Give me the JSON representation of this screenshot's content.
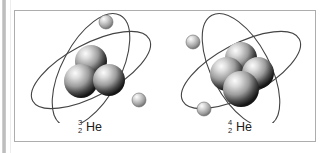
{
  "figure": {
    "caption": "",
    "panel_border_color": "#adadad",
    "background_color": "#ffffff",
    "atoms": [
      {
        "id": "helium-3",
        "element_symbol": "He",
        "mass_number": "3",
        "atomic_number": "2",
        "label_text": "3 2 He",
        "protons": 2,
        "neutrons": 1,
        "nucleon_count": 3,
        "electron_count": 2,
        "orbit_count": 2,
        "nucleons": [
          {
            "name": "nucleon-top",
            "cx": 76,
            "cy": 50,
            "r": 16
          },
          {
            "name": "nucleon-left",
            "cx": 66,
            "cy": 70,
            "r": 17
          },
          {
            "name": "nucleon-right",
            "cx": 94,
            "cy": 69,
            "r": 16
          }
        ],
        "electrons": [
          {
            "name": "electron-1",
            "cx": 91,
            "cy": 11,
            "r": 7
          },
          {
            "name": "electron-2",
            "cx": 124,
            "cy": 89,
            "r": 7
          }
        ],
        "orbits": [
          {
            "name": "orbit-1",
            "cx": 76,
            "cy": 59,
            "rx": 66,
            "ry": 26,
            "rotate": -28
          },
          {
            "name": "orbit-2",
            "cx": 76,
            "cy": 59,
            "rx": 62,
            "ry": 29,
            "rotate": -62
          }
        ]
      },
      {
        "id": "helium-4",
        "element_symbol": "He",
        "mass_number": "4",
        "atomic_number": "2",
        "label_text": "4 2 He",
        "protons": 2,
        "neutrons": 2,
        "nucleon_count": 4,
        "electron_count": 2,
        "orbit_count": 2,
        "nucleons": [
          {
            "name": "nucleon-back-top",
            "cx": 76,
            "cy": 47,
            "r": 16
          },
          {
            "name": "nucleon-left",
            "cx": 62,
            "cy": 63,
            "r": 17
          },
          {
            "name": "nucleon-right",
            "cx": 93,
            "cy": 62,
            "r": 16
          },
          {
            "name": "nucleon-front",
            "cx": 76,
            "cy": 78,
            "r": 18
          }
        ],
        "electrons": [
          {
            "name": "electron-1",
            "cx": 28,
            "cy": 31,
            "r": 7
          },
          {
            "name": "electron-2",
            "cx": 39,
            "cy": 98,
            "r": 7
          }
        ],
        "orbits": [
          {
            "name": "orbit-1",
            "cx": 76,
            "cy": 59,
            "rx": 66,
            "ry": 26,
            "rotate": -28
          },
          {
            "name": "orbit-2",
            "cx": 76,
            "cy": 59,
            "rx": 62,
            "ry": 29,
            "rotate": 62
          }
        ]
      }
    ],
    "colors": {
      "orbit_stroke": "#444444",
      "nucleon_light": "#f2f2f2",
      "nucleon_mid": "#9a9a9a",
      "nucleon_dark": "#1c1c1c",
      "electron_light": "#f5f5f5",
      "electron_dark": "#8e8e8e",
      "label_text": "#1b1b1b",
      "left_stripe": "#b7b7b7"
    }
  }
}
